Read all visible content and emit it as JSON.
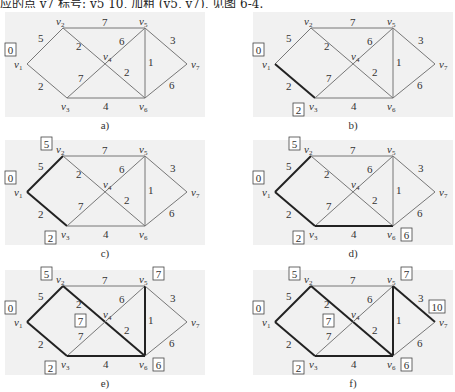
{
  "top_text": "应的点 v7 标号: v5 10, 加粗 (v5, v7), 见图 6-4.",
  "nodes": [
    {
      "id": "v1",
      "label": "v",
      "sub": "1",
      "x": 27,
      "y": 64
    },
    {
      "id": "v2",
      "label": "v",
      "sub": "2",
      "x": 63,
      "y": 28
    },
    {
      "id": "v3",
      "label": "v",
      "sub": "3",
      "x": 67,
      "y": 98
    },
    {
      "id": "v4",
      "label": "v",
      "sub": "4",
      "x": 105,
      "y": 66
    },
    {
      "id": "v5",
      "label": "v",
      "sub": "5",
      "x": 145,
      "y": 28
    },
    {
      "id": "v6",
      "label": "v",
      "sub": "6",
      "x": 145,
      "y": 98
    },
    {
      "id": "v7",
      "label": "v",
      "sub": "7",
      "x": 187,
      "y": 64
    }
  ],
  "edges": [
    {
      "id": "v1-v2",
      "from": "v1",
      "to": "v2",
      "weight": "5"
    },
    {
      "id": "v1-v3",
      "from": "v1",
      "to": "v3",
      "weight": "2"
    },
    {
      "id": "v2-v5",
      "from": "v2",
      "to": "v5",
      "weight": "7"
    },
    {
      "id": "v2-v6",
      "from": "v2",
      "to": "v6",
      "weight": "2"
    },
    {
      "id": "v3-v5",
      "from": "v3",
      "to": "v5",
      "weight": "7"
    },
    {
      "id": "v3-v6",
      "from": "v3",
      "to": "v6",
      "weight": "4"
    },
    {
      "id": "v5-v6",
      "from": "v5",
      "to": "v6",
      "weight": "1"
    },
    {
      "id": "v5-v7",
      "from": "v5",
      "to": "v7",
      "weight": "3"
    },
    {
      "id": "v6-v7",
      "from": "v6",
      "to": "v7",
      "weight": "6"
    }
  ],
  "weight_labels": [
    {
      "text": "5",
      "x": 38,
      "y": 42
    },
    {
      "text": "2",
      "x": 38,
      "y": 90
    },
    {
      "text": "7",
      "x": 102,
      "y": 26
    },
    {
      "text": "2",
      "x": 76,
      "y": 50
    },
    {
      "text": "6",
      "x": 119,
      "y": 45
    },
    {
      "text": "7",
      "x": 78,
      "y": 82
    },
    {
      "text": "2",
      "x": 124,
      "y": 76
    },
    {
      "text": "4",
      "x": 103,
      "y": 110
    },
    {
      "text": "1",
      "x": 148,
      "y": 66
    },
    {
      "text": "3",
      "x": 170,
      "y": 44
    },
    {
      "text": "6",
      "x": 169,
      "y": 89
    }
  ],
  "panels": [
    {
      "caption": "a)",
      "dx": 0,
      "dy": 0,
      "bold": [],
      "marks": [
        {
          "node": "v1",
          "text": "0"
        }
      ]
    },
    {
      "caption": "b)",
      "dx": 248,
      "dy": 0,
      "bold": [
        "v1-v3"
      ],
      "marks": [
        {
          "node": "v1",
          "text": "0"
        },
        {
          "node": "v3",
          "text": "2"
        }
      ]
    },
    {
      "caption": "c)",
      "dx": 0,
      "dy": 128,
      "bold": [
        "v1-v3",
        "v1-v2"
      ],
      "marks": [
        {
          "node": "v1",
          "text": "0"
        },
        {
          "node": "v2",
          "text": "5"
        },
        {
          "node": "v3",
          "text": "2"
        }
      ]
    },
    {
      "caption": "d)",
      "dx": 248,
      "dy": 128,
      "bold": [
        "v1-v3",
        "v1-v2",
        "v3-v6"
      ],
      "marks": [
        {
          "node": "v1",
          "text": "0"
        },
        {
          "node": "v2",
          "text": "5"
        },
        {
          "node": "v3",
          "text": "2"
        },
        {
          "node": "v6",
          "text": "6"
        }
      ]
    },
    {
      "caption": "e)",
      "dx": 0,
      "dy": 258,
      "bold": [
        "v1-v3",
        "v1-v2",
        "v3-v6",
        "v2-v6",
        "v5-v6"
      ],
      "marks": [
        {
          "node": "v1",
          "text": "0"
        },
        {
          "node": "v2",
          "text": "5"
        },
        {
          "node": "v3",
          "text": "2"
        },
        {
          "node": "v6",
          "text": "6"
        },
        {
          "node": "v5",
          "text": "7"
        },
        {
          "node": "v4",
          "text": "7"
        }
      ]
    },
    {
      "caption": "f)",
      "dx": 248,
      "dy": 258,
      "bold": [
        "v1-v3",
        "v1-v2",
        "v3-v6",
        "v2-v6",
        "v5-v6",
        "v5-v7"
      ],
      "marks": [
        {
          "node": "v1",
          "text": "0"
        },
        {
          "node": "v2",
          "text": "5"
        },
        {
          "node": "v3",
          "text": "2"
        },
        {
          "node": "v6",
          "text": "6"
        },
        {
          "node": "v5",
          "text": "7"
        },
        {
          "node": "v4",
          "text": "7"
        },
        {
          "node": "v7",
          "text": "10"
        }
      ]
    }
  ],
  "colors": {
    "panel_bg": "#f1f1f1",
    "edge": "#777777",
    "bold_edge": "#222222",
    "text": "#333333"
  }
}
